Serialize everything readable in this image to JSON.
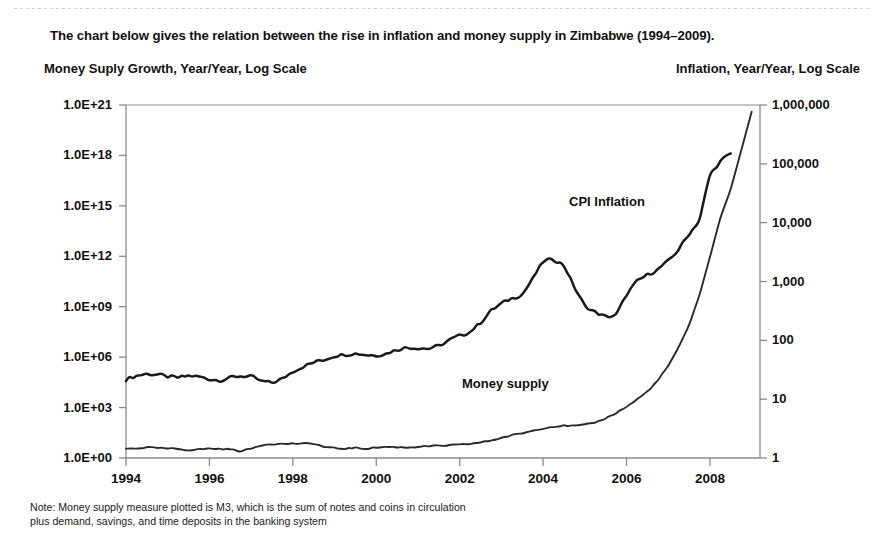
{
  "headline": "The chart below gives the relation between the rise in inflation and money supply in Zimbabwe (1994–2009).",
  "axis_title_left": "Money Suply Growth, Year/Year, Log Scale",
  "axis_title_right": "Inflation, Year/Year, Log Scale",
  "note_line1": "Note: Money supply measure plotted is M3, which is the sum of notes and coins in circulation",
  "note_line2": "plus demand, savings, and time deposits in the banking system",
  "colors": {
    "axis": "#8a8a8a",
    "series_inflation": "#1a1a1a",
    "series_money": "#2a2a2a",
    "text": "#111111"
  },
  "chart_data": {
    "type": "line",
    "title": "The chart below gives the relation between the rise in inflation and money supply in Zimbabwe (1994–2009).",
    "xlabel": "",
    "ylabel": "Money Suply Growth, Year/Year, Log Scale",
    "ylabel_right": "Inflation, Year/Year, Log Scale",
    "grid": false,
    "legend_position": "inline-annotation",
    "xlim": [
      1994,
      2009.2
    ],
    "x_ticks": [
      "1994",
      "1996",
      "1998",
      "2000",
      "2002",
      "2004",
      "2006",
      "2008"
    ],
    "x_tick_values": [
      1994,
      1996,
      1998,
      2000,
      2002,
      2004,
      2006,
      2008
    ],
    "y_left_axis": {
      "label": "Money Suply Growth, Year/Year, Log Scale",
      "scale": "log",
      "ticks": [
        "1.0E+00",
        "1.0E+03",
        "1.0E+06",
        "1.0E+09",
        "1.0E+12",
        "1.0E+15",
        "1.0E+18",
        "1.0E+21"
      ],
      "tick_values": [
        1,
        1000,
        1000000,
        1000000000,
        1000000000000,
        1000000000000000,
        1e+18,
        1e+21
      ],
      "ylim": [
        1,
        1e+21
      ]
    },
    "y_right_axis": {
      "label": "Inflation, Year/Year, Log Scale",
      "scale": "log",
      "ticks": [
        "1",
        "10",
        "100",
        "1,000",
        "10,000",
        "100,000",
        "1,000,000"
      ],
      "tick_values": [
        1,
        10,
        100,
        1000,
        10000,
        100000,
        1000000
      ],
      "ylim": [
        1,
        1000000
      ]
    },
    "annotations": [
      {
        "text": "CPI Inflation",
        "x": 2005.1,
        "y_axis": "right"
      },
      {
        "text": "Money supply",
        "x": 2003.3,
        "y_axis": "left"
      }
    ],
    "series": [
      {
        "name": "CPI Inflation",
        "axis": "right",
        "units": "percent year/year",
        "x": [
          1994.0,
          1994.25,
          1994.5,
          1994.75,
          1995.0,
          1995.25,
          1995.5,
          1995.75,
          1996.0,
          1996.25,
          1996.5,
          1996.75,
          1997.0,
          1997.25,
          1997.5,
          1997.75,
          1998.0,
          1998.25,
          1998.5,
          1998.75,
          1999.0,
          1999.25,
          1999.5,
          1999.75,
          2000.0,
          2000.25,
          2000.5,
          2000.75,
          2001.0,
          2001.25,
          2001.5,
          2001.75,
          2002.0,
          2002.25,
          2002.5,
          2002.75,
          2003.0,
          2003.25,
          2003.5,
          2003.75,
          2004.0,
          2004.25,
          2004.5,
          2004.75,
          2005.0,
          2005.25,
          2005.5,
          2005.75,
          2006.0,
          2006.25,
          2006.5,
          2006.75,
          2007.0,
          2007.25,
          2007.5,
          2007.75,
          2008.0,
          2008.25,
          2008.5
        ],
        "y": [
          22,
          25,
          27,
          26,
          24,
          23,
          25,
          24,
          22,
          21,
          23,
          25,
          24,
          20,
          19,
          22,
          30,
          36,
          42,
          47,
          55,
          58,
          60,
          57,
          56,
          60,
          70,
          76,
          75,
          72,
          80,
          100,
          120,
          140,
          200,
          320,
          420,
          520,
          600,
          1100,
          2200,
          2400,
          1900,
          800,
          380,
          300,
          250,
          265,
          600,
          1000,
          1300,
          1600,
          2200,
          3500,
          6500,
          11000,
          66000,
          110000,
          150000
        ]
      },
      {
        "name": "Money supply",
        "axis": "left",
        "units": "M3 index, log scale",
        "x": [
          1994.0,
          1994.25,
          1994.5,
          1994.75,
          1995.0,
          1995.25,
          1995.5,
          1995.75,
          1996.0,
          1996.25,
          1996.5,
          1996.75,
          1997.0,
          1997.25,
          1997.5,
          1997.75,
          1998.0,
          1998.25,
          1998.5,
          1998.75,
          1999.0,
          1999.25,
          1999.5,
          1999.75,
          2000.0,
          2000.25,
          2000.5,
          2000.75,
          2001.0,
          2001.25,
          2001.5,
          2001.75,
          2002.0,
          2002.25,
          2002.5,
          2002.75,
          2003.0,
          2003.25,
          2003.5,
          2003.75,
          2004.0,
          2004.25,
          2004.5,
          2004.75,
          2005.0,
          2005.25,
          2005.5,
          2005.75,
          2006.0,
          2006.25,
          2006.5,
          2006.75,
          2007.0,
          2007.25,
          2007.5,
          2007.75,
          2008.0,
          2008.25,
          2008.5,
          2008.75,
          2009.0
        ],
        "y": [
          3.5,
          3.8,
          4.2,
          3.9,
          3.6,
          3.4,
          3.0,
          3.3,
          3.6,
          3.5,
          3.3,
          2.6,
          3.5,
          6.0,
          7.0,
          6.8,
          7.2,
          7.0,
          7.4,
          4.5,
          3.8,
          3.6,
          4.0,
          3.6,
          4.2,
          4.6,
          4.4,
          4.2,
          4.8,
          5.0,
          5.2,
          5.6,
          6.0,
          7.0,
          8.5,
          11,
          16,
          22,
          30,
          42,
          60,
          75,
          85,
          80,
          92,
          130,
          230,
          480,
          1100,
          3000,
          9000,
          40000,
          300000,
          4000000,
          80000000,
          5000000000,
          900000000000,
          200000000000000.0,
          1e+16,
          2e+18,
          4e+20
        ]
      }
    ]
  }
}
